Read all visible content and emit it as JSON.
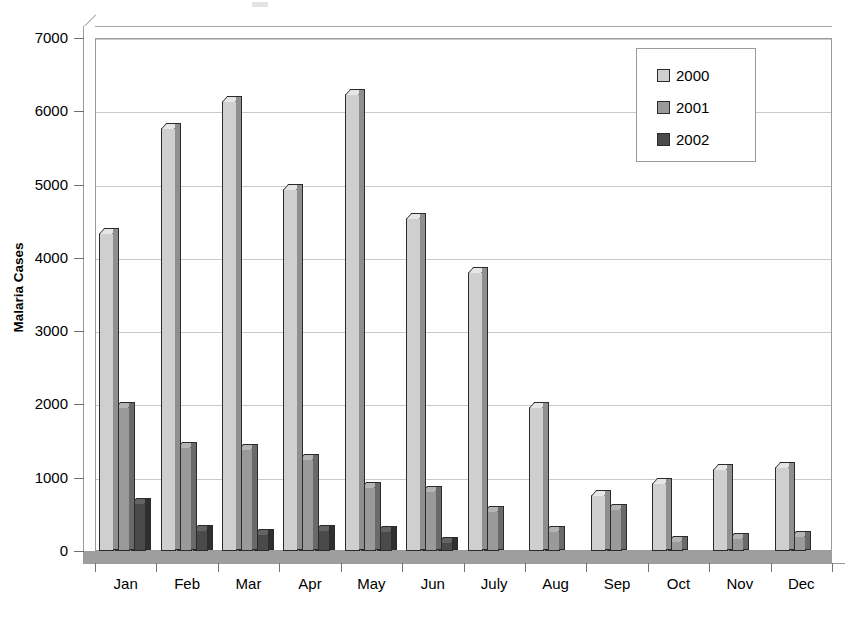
{
  "chart_data": {
    "type": "bar",
    "title": "",
    "subtitle": "",
    "xlabel": "",
    "ylabel": "Malaria Cases",
    "ylim": [
      0,
      7000
    ],
    "ytick_step": 1000,
    "yticks": [
      "7000",
      "6000",
      "5000",
      "4000",
      "3000",
      "2000",
      "1000",
      "0"
    ],
    "grid": true,
    "legend_position": "top-right",
    "style": "3d-clustered-column",
    "categories": [
      "Jan",
      "Feb",
      "Mar",
      "Apr",
      "May",
      "Jun",
      "July",
      "Aug",
      "Sep",
      "Oct",
      "Nov",
      "Dec"
    ],
    "series": [
      {
        "name": "2000",
        "color": "#cfcfcf",
        "values": [
          4340,
          5770,
          6140,
          4940,
          6230,
          4540,
          3810,
          1960,
          760,
          930,
          1120,
          1150
        ]
      },
      {
        "name": "2001",
        "color": "#9a9a9a",
        "values": [
          1960,
          1420,
          1390,
          1250,
          870,
          820,
          540,
          270,
          570,
          130,
          180,
          200
        ]
      },
      {
        "name": "2002",
        "color": "#4a4a4a",
        "values": [
          660,
          290,
          230,
          280,
          270,
          120,
          0,
          0,
          0,
          0,
          0,
          0
        ]
      }
    ]
  },
  "legend": {
    "items": [
      {
        "label": "2000",
        "color": "#cfcfcf"
      },
      {
        "label": "2001",
        "color": "#9a9a9a"
      },
      {
        "label": "2002",
        "color": "#4a4a4a"
      }
    ]
  },
  "axes": {
    "y_title": "Malaria Cases",
    "y_max": 7000,
    "y_min": 0
  },
  "colors": {
    "series_2000": "#cfcfcf",
    "series_2001": "#9a9a9a",
    "series_2002": "#4a4a4a",
    "gridline": "#c9c9c9",
    "axis": "#9b9b9b",
    "floor": "#9e9e9e",
    "background": "#ffffff"
  }
}
